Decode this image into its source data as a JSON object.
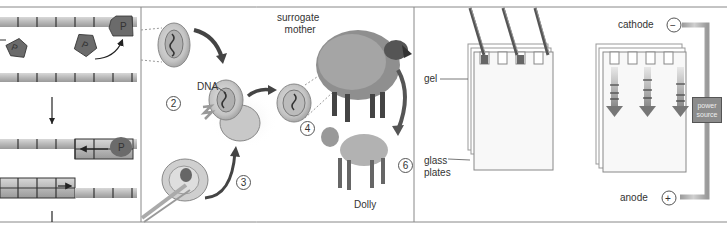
{
  "figure": {
    "type": "textbook-illustration",
    "panels": [
      {
        "id": "polymerase-panel",
        "description": "DNA strand segments with P (polymerase) pentagons and arrows",
        "labels": [
          "P",
          "P",
          "P",
          "P"
        ]
      },
      {
        "id": "cloning-panel",
        "description": "Nuclear transfer cloning steps leading to Dolly",
        "labels": {
          "dna": "DNA",
          "surrogate": "surrogate\nmother",
          "surrogate_line1": "surrogate",
          "surrogate_line2": "mother",
          "dolly": "Dolly"
        },
        "steps": [
          "2",
          "3",
          "4",
          "6"
        ]
      },
      {
        "id": "electrophoresis-panel",
        "description": "Gel electrophoresis apparatus",
        "labels": {
          "gel": "gel",
          "glass_line1": "glass",
          "glass_line2": "plates",
          "cathode": "cathode",
          "cathode_sign": "−",
          "anode": "anode",
          "anode_sign": "+",
          "power_line1": "power",
          "power_line2": "source"
        }
      }
    ],
    "colors": {
      "border": "#888888",
      "strand": "#b5b5b5",
      "polymerase": "#6b6b6b",
      "power_source": "#8c8c8c",
      "wire": "#a8a8a8",
      "background": "#ffffff"
    }
  }
}
